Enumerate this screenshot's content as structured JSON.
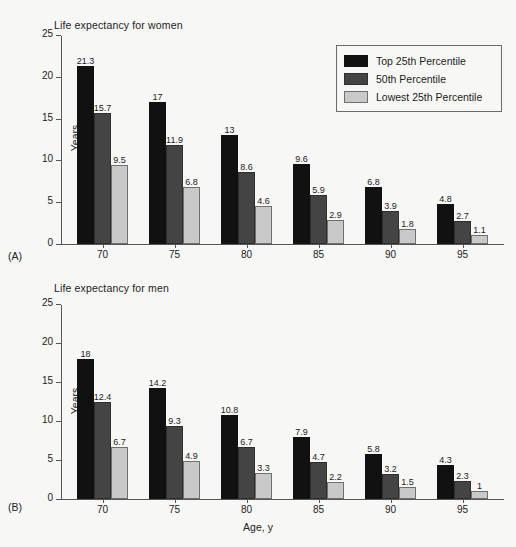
{
  "figure": {
    "background_color": "#f7f7f5",
    "axis_color": "#565656",
    "text_color": "#1c1c1c"
  },
  "legend": {
    "position": "top-right",
    "entries": [
      {
        "label": "Top 25th Percentile",
        "color": "#111111"
      },
      {
        "label": "50th Percentile",
        "color": "#444444"
      },
      {
        "label": "Lowest 25th Percentile",
        "color": "#c9c9c9"
      }
    ]
  },
  "panels": [
    {
      "letter": "(A)",
      "title": "Life expectancy for women"
    },
    {
      "letter": "(B)",
      "title": "Life expectancy for men"
    }
  ],
  "axis": {
    "ylabel": "Years",
    "xlabel": "Age, y",
    "yticks": [
      "25",
      "20",
      "15",
      "10",
      "5",
      "0"
    ],
    "xticks": [
      "70",
      "75",
      "80",
      "85",
      "90",
      "95"
    ]
  },
  "chart_data": [
    {
      "type": "bar",
      "title": "Life expectancy for women",
      "panel": "(A)",
      "xlabel": "",
      "ylabel": "Years",
      "ylim": [
        0,
        25
      ],
      "ytick_values": [
        0,
        5,
        10,
        15,
        20,
        25
      ],
      "grid": false,
      "legend_position": "top-right",
      "categories": [
        "70",
        "75",
        "80",
        "85",
        "90",
        "95"
      ],
      "series": [
        {
          "name": "Top 25th Percentile",
          "color": "#111111",
          "values": [
            21.3,
            17,
            13,
            9.6,
            6.8,
            4.8
          ],
          "labels": [
            "21.3",
            "17",
            "13",
            "9.6",
            "6.8",
            "4.8"
          ]
        },
        {
          "name": "50th Percentile",
          "color": "#444444",
          "values": [
            15.7,
            11.9,
            8.6,
            5.9,
            3.9,
            2.7
          ],
          "labels": [
            "15.7",
            "11.9",
            "8.6",
            "5.9",
            "3.9",
            "2.7"
          ]
        },
        {
          "name": "Lowest 25th Percentile",
          "color": "#c9c9c9",
          "values": [
            9.5,
            6.8,
            4.6,
            2.9,
            1.8,
            1.1
          ],
          "labels": [
            "9.5",
            "6.8",
            "4.6",
            "2.9",
            "1.8",
            "1.1"
          ]
        }
      ]
    },
    {
      "type": "bar",
      "title": "Life expectancy for men",
      "panel": "(B)",
      "xlabel": "Age, y",
      "ylabel": "Years",
      "ylim": [
        0,
        25
      ],
      "ytick_values": [
        0,
        5,
        10,
        15,
        20,
        25
      ],
      "grid": false,
      "legend_position": "none",
      "categories": [
        "70",
        "75",
        "80",
        "85",
        "90",
        "95"
      ],
      "series": [
        {
          "name": "Top 25th Percentile",
          "color": "#111111",
          "values": [
            18,
            14.2,
            10.8,
            7.9,
            5.8,
            4.3
          ],
          "labels": [
            "18",
            "14.2",
            "10.8",
            "7.9",
            "5.8",
            "4.3"
          ]
        },
        {
          "name": "50th Percentile",
          "color": "#444444",
          "values": [
            12.4,
            9.3,
            6.7,
            4.7,
            3.2,
            2.3
          ],
          "labels": [
            "12.4",
            "9.3",
            "6.7",
            "4.7",
            "3.2",
            "2.3"
          ]
        },
        {
          "name": "Lowest 25th Percentile",
          "color": "#c9c9c9",
          "values": [
            6.7,
            4.9,
            3.3,
            2.2,
            1.5,
            1
          ],
          "labels": [
            "6.7",
            "4.9",
            "3.3",
            "2.2",
            "1.5",
            "1"
          ]
        }
      ]
    }
  ]
}
